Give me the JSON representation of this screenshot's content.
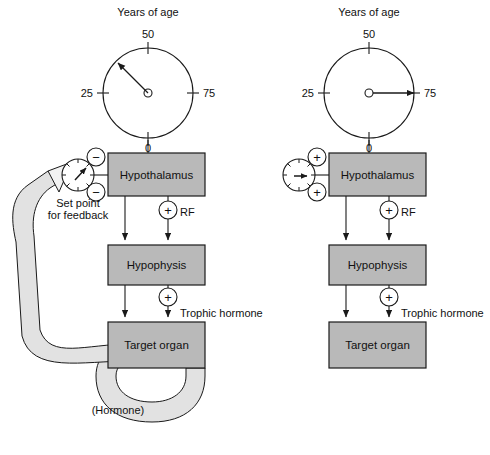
{
  "figure": {
    "background": "#ffffff",
    "ink": "#1a1a1a",
    "box_fill": "#b9b9b9",
    "band_fill": "#e2e2e2"
  },
  "panels": [
    {
      "id": "left",
      "clock": {
        "title": "Years of age",
        "ticks": [
          {
            "label": "50",
            "value": 50,
            "angle_deg": 90
          },
          {
            "label": "25",
            "value": 25,
            "angle_deg": 180
          },
          {
            "label": "75",
            "value": 75,
            "angle_deg": 0
          },
          {
            "label": "0",
            "value": 0,
            "angle_deg": 270
          }
        ],
        "hand_angle_deg": 125,
        "hand_points_to": "between 25 and 50"
      },
      "gauge": {
        "label_line1": "Set point",
        "label_line2": "for feedback",
        "needle_angle_deg": 55
      },
      "signs": [
        {
          "glyph": "−",
          "name": "minus-upper"
        },
        {
          "glyph": "−",
          "name": "minus-lower"
        },
        {
          "glyph": "+",
          "name": "plus-rf",
          "label": "RF"
        },
        {
          "glyph": "+",
          "name": "plus-trophic",
          "label": "Trophic hormone"
        }
      ],
      "boxes": [
        {
          "label": "Hypothalamus"
        },
        {
          "label": "Hypophysis"
        },
        {
          "label": "Target organ"
        }
      ],
      "feedback": {
        "label": "(Hormone)",
        "present": true
      }
    },
    {
      "id": "right",
      "clock": {
        "title": "Years of age",
        "ticks": [
          {
            "label": "50",
            "value": 50,
            "angle_deg": 90
          },
          {
            "label": "25",
            "value": 25,
            "angle_deg": 180
          },
          {
            "label": "75",
            "value": 75,
            "angle_deg": 0
          },
          {
            "label": "0",
            "value": 0,
            "angle_deg": 270
          }
        ],
        "hand_angle_deg": 0,
        "hand_points_to": "75"
      },
      "gauge": {
        "label_line1": "",
        "label_line2": "",
        "needle_angle_deg": 0
      },
      "signs": [
        {
          "glyph": "+",
          "name": "plus-upper"
        },
        {
          "glyph": "+",
          "name": "plus-lower"
        },
        {
          "glyph": "+",
          "name": "plus-rf",
          "label": "RF"
        },
        {
          "glyph": "+",
          "name": "plus-trophic",
          "label": "Trophic hormone"
        }
      ],
      "boxes": [
        {
          "label": "Hypothalamus"
        },
        {
          "label": "Hypophysis"
        },
        {
          "label": "Target organ"
        }
      ],
      "feedback": {
        "label": "",
        "present": false
      }
    }
  ]
}
